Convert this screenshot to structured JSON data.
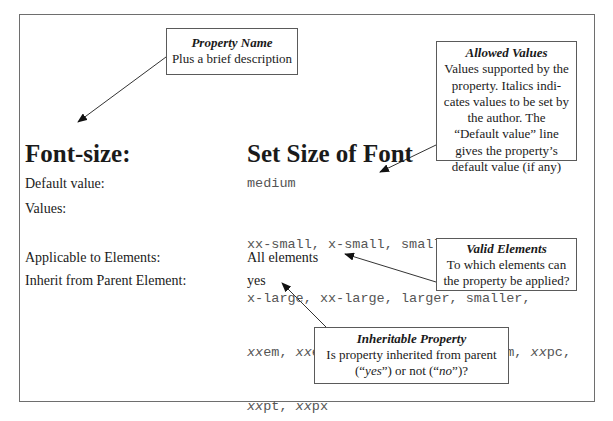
{
  "property": {
    "name": "Font-size:",
    "description": "Set Size of Font"
  },
  "rows": [
    {
      "label": "Default value:",
      "value": "medium"
    },
    {
      "label": "Values:",
      "value_lines": [
        "xx-small, x-small, small, medium, large,",
        "x-large, xx-large, larger, smaller,"
      ],
      "author_values_lines": [
        [
          "xx",
          "em, ",
          "xx",
          "ex, ",
          "xx",
          "%, ",
          "xx",
          "cm, ",
          "xx",
          "in, ",
          "xx",
          "mm, ",
          "xx",
          "pc,"
        ],
        [
          "xx",
          "pt, ",
          "xx",
          "px"
        ]
      ]
    },
    {
      "label": "Applicable to Elements:",
      "value": "All elements"
    },
    {
      "label": "Inherit from Parent Element:",
      "value": "yes"
    }
  ],
  "callouts": {
    "property_name": {
      "title": "Property Name",
      "text": "Plus a brief description"
    },
    "allowed_values": {
      "title": "Allowed Values",
      "lines": [
        "Values supported by the",
        "property. Italics indi-",
        "cates values to be set by",
        "the author. The",
        "“Default value” line",
        "gives the property’s",
        "default value (if any)"
      ]
    },
    "valid_elements": {
      "title": "Valid Elements",
      "lines": [
        "To which elements can",
        "the property be applied?"
      ]
    },
    "inheritable": {
      "title": "Inheritable Property",
      "line1": "Is property inherited from parent",
      "line2_parts": [
        "(“",
        "yes",
        "”) or not (“",
        "no",
        "”)?"
      ]
    }
  }
}
